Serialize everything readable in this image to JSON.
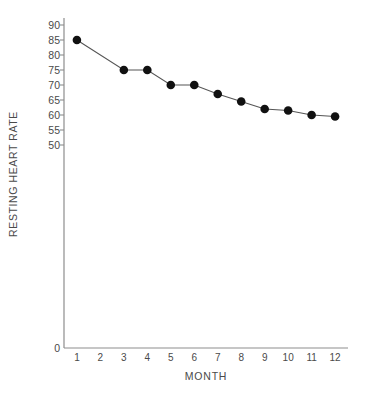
{
  "chart_data": {
    "type": "line",
    "title": "",
    "xlabel": "MONTH",
    "ylabel": "RESTING HEART RATE",
    "categories": [
      1,
      2,
      3,
      4,
      5,
      6,
      7,
      8,
      9,
      10,
      11,
      12
    ],
    "x_tick_labels": [
      "1",
      "2",
      "3",
      "4",
      "5",
      "6",
      "7",
      "8",
      "9",
      "10",
      "11",
      "12"
    ],
    "y_tick_labels": [
      "90",
      "85",
      "80",
      "75",
      "70",
      "65",
      "60",
      "55",
      "50",
      "0"
    ],
    "y_tick_values": [
      90,
      85,
      80,
      75,
      70,
      65,
      60,
      55,
      50,
      0
    ],
    "values": [
      85,
      null,
      75,
      75,
      70,
      70,
      67,
      64.5,
      62,
      61.5,
      60,
      59.5
    ],
    "points": [
      {
        "x": 1,
        "y": 85
      },
      {
        "x": 3,
        "y": 75
      },
      {
        "x": 4,
        "y": 75
      },
      {
        "x": 5,
        "y": 70
      },
      {
        "x": 6,
        "y": 70
      },
      {
        "x": 7,
        "y": 67
      },
      {
        "x": 8,
        "y": 64.5
      },
      {
        "x": 9,
        "y": 62
      },
      {
        "x": 10,
        "y": 61.5
      },
      {
        "x": 11,
        "y": 60
      },
      {
        "x": 12,
        "y": 59.5
      }
    ],
    "xlim": [
      0.45,
      12.55
    ],
    "ylim": [
      50,
      90
    ],
    "y_axis_broken": true,
    "grid": false,
    "legend": null,
    "marker": "filled-circle",
    "marker_color": "#111111",
    "line_color": "#555555",
    "axis_color": "#888888",
    "text_color": "#4a4a4a",
    "background": "#ffffff"
  }
}
